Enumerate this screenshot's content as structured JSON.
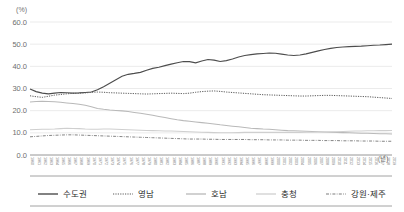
{
  "chart_data": {
    "type": "line",
    "title": "",
    "xlabel": "(년)",
    "ylabel": "(%)",
    "ylim": [
      0,
      60
    ],
    "yticks": [
      "0.0",
      "10.0",
      "20.0",
      "30.0",
      "40.0",
      "50.0",
      "60.0"
    ],
    "grid": true,
    "legend_position": "bottom",
    "x": [
      1960,
      1961,
      1962,
      1963,
      1964,
      1965,
      1966,
      1967,
      1968,
      1969,
      1970,
      1971,
      1972,
      1973,
      1974,
      1975,
      1976,
      1977,
      1978,
      1979,
      1980,
      1981,
      1982,
      1983,
      1984,
      1985,
      1986,
      1987,
      1988,
      1989,
      1990,
      1991,
      1992,
      1993,
      1994,
      1995,
      1996,
      1997,
      1998,
      1999,
      2000,
      2001,
      2002,
      2003,
      2004,
      2005,
      2006,
      2007,
      2008,
      2009,
      2010,
      2011,
      2012,
      2013,
      2014,
      2015,
      2016,
      2017,
      2018,
      2019
    ],
    "xtick_labels": [
      "1960",
      "1961",
      "1962",
      "1963",
      "1964",
      "1965",
      "1966",
      "1967",
      "1968",
      "1969",
      "1970",
      "1971",
      "1972",
      "1973",
      "1974",
      "1975",
      "1976",
      "1977",
      "1978",
      "1979",
      "1980",
      "1981",
      "1982",
      "1983",
      "1984",
      "1985",
      "1986",
      "1987",
      "1988",
      "1989",
      "1990",
      "1991",
      "1992",
      "1993",
      "1994",
      "1995",
      "1996",
      "1997",
      "1998",
      "1999",
      "2000",
      "2001",
      "2002",
      "2003",
      "2004",
      "2005",
      "2006",
      "2007",
      "2008",
      "2009",
      "2010",
      "2011",
      "2012",
      "2013",
      "2014",
      "2015",
      "2016",
      "2017",
      "2018",
      "2019"
    ],
    "series": [
      {
        "name": "수도권",
        "style": "solid",
        "color": "#4d4d4d",
        "values": [
          29.8,
          28.6,
          27.9,
          27.6,
          27.9,
          28.2,
          28.1,
          27.9,
          28.0,
          28.2,
          28.4,
          29.4,
          30.8,
          32.4,
          34.0,
          35.5,
          36.4,
          36.8,
          37.3,
          38.2,
          39.1,
          39.6,
          40.3,
          41.0,
          41.6,
          42.2,
          42.1,
          41.6,
          42.4,
          43.1,
          42.8,
          42.2,
          42.6,
          43.3,
          44.2,
          44.9,
          45.3,
          45.6,
          45.8,
          46.0,
          45.9,
          45.5,
          45.1,
          44.9,
          45.1,
          45.6,
          46.3,
          47.0,
          47.6,
          48.1,
          48.5,
          48.7,
          48.9,
          49.0,
          49.1,
          49.3,
          49.5,
          49.6,
          49.8,
          50.0
        ]
      },
      {
        "name": "영남",
        "style": "dotted",
        "color": "#5a5a5a",
        "values": [
          26.7,
          26.3,
          26.0,
          26.5,
          27.0,
          27.3,
          27.6,
          27.8,
          27.9,
          28.0,
          28.3,
          28.4,
          28.3,
          28.1,
          28.0,
          27.9,
          27.8,
          27.7,
          27.6,
          27.5,
          27.6,
          27.7,
          27.8,
          27.9,
          27.8,
          27.7,
          27.9,
          28.3,
          28.6,
          28.8,
          28.9,
          28.7,
          28.4,
          28.2,
          28.0,
          27.8,
          27.6,
          27.4,
          27.2,
          27.1,
          27.0,
          26.9,
          26.8,
          26.7,
          26.6,
          26.6,
          26.7,
          26.8,
          26.9,
          26.9,
          26.8,
          26.7,
          26.6,
          26.5,
          26.4,
          26.3,
          26.1,
          25.9,
          25.7,
          25.5
        ]
      },
      {
        "name": "호남",
        "style": "solid",
        "color": "#b9b9b9",
        "values": [
          23.9,
          24.1,
          24.2,
          24.1,
          24.0,
          23.8,
          23.5,
          23.2,
          22.9,
          22.4,
          21.8,
          21.0,
          20.6,
          20.3,
          20.1,
          19.9,
          19.6,
          19.2,
          18.8,
          18.4,
          17.9,
          17.4,
          16.9,
          16.4,
          15.9,
          15.5,
          15.2,
          14.9,
          14.6,
          14.3,
          14.0,
          13.6,
          13.3,
          13.0,
          12.7,
          12.4,
          12.1,
          11.9,
          11.7,
          11.6,
          11.4,
          11.2,
          11.0,
          10.9,
          10.8,
          10.7,
          10.6,
          10.5,
          10.4,
          10.3,
          10.2,
          10.1,
          10.0,
          9.9,
          9.8,
          9.8,
          9.7,
          9.6,
          9.6,
          9.5
        ]
      },
      {
        "name": "충청",
        "style": "solid",
        "color": "#cfcfcf",
        "values": [
          11.4,
          11.5,
          11.6,
          11.6,
          11.7,
          11.9,
          12.1,
          12.0,
          11.9,
          11.7,
          11.6,
          11.6,
          11.7,
          11.7,
          11.6,
          11.5,
          11.4,
          11.3,
          11.2,
          11.1,
          11.0,
          10.9,
          10.8,
          10.8,
          10.7,
          10.6,
          10.5,
          10.4,
          10.3,
          10.2,
          10.1,
          10.0,
          10.0,
          10.0,
          10.1,
          10.2,
          10.2,
          10.2,
          10.2,
          10.2,
          10.2,
          10.2,
          10.2,
          10.2,
          10.2,
          10.3,
          10.3,
          10.4,
          10.4,
          10.5,
          10.5,
          10.6,
          10.7,
          10.8,
          10.8,
          10.9,
          10.9,
          11.0,
          11.0,
          11.1
        ]
      },
      {
        "name": "강원·제주",
        "style": "dashdot",
        "color": "#7d7d7d",
        "values": [
          8.2,
          8.4,
          8.6,
          8.8,
          8.9,
          9.0,
          9.1,
          9.1,
          9.0,
          8.9,
          8.8,
          8.7,
          8.6,
          8.5,
          8.4,
          8.3,
          8.2,
          8.1,
          8.0,
          7.9,
          7.8,
          7.7,
          7.6,
          7.5,
          7.4,
          7.3,
          7.2,
          7.2,
          7.2,
          7.1,
          7.1,
          7.0,
          7.0,
          7.0,
          7.0,
          7.0,
          6.9,
          6.9,
          6.9,
          6.8,
          6.8,
          6.8,
          6.7,
          6.7,
          6.7,
          6.6,
          6.6,
          6.6,
          6.5,
          6.5,
          6.5,
          6.4,
          6.4,
          6.4,
          6.3,
          6.3,
          6.3,
          6.2,
          6.2,
          6.2
        ]
      }
    ]
  },
  "axis": {
    "unit_y": "(%)",
    "unit_x": "(년)"
  },
  "legend": {
    "items": [
      {
        "label": "수도권",
        "marker": "line-solid-dark"
      },
      {
        "label": "영남",
        "marker": "line-dotted"
      },
      {
        "label": "호남",
        "marker": "line-solid-light"
      },
      {
        "label": "충청",
        "marker": "line-solid-lighter"
      },
      {
        "label": "강원·제주",
        "marker": "line-dashdot"
      }
    ]
  }
}
